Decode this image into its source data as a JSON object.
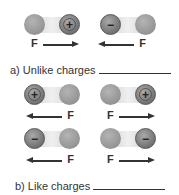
{
  "figure": {
    "section_a": {
      "label": "a) Unlike charges",
      "pairs": [
        {
          "left": {
            "type": "neutral",
            "sign": ""
          },
          "right": {
            "type": "charged",
            "sign": "+"
          },
          "force_label": "F",
          "force_direction": "right"
        },
        {
          "left": {
            "type": "charged",
            "sign": "−"
          },
          "right": {
            "type": "neutral",
            "sign": ""
          },
          "force_label": "F",
          "force_direction": "left"
        }
      ]
    },
    "section_b": {
      "label": "b) Like charges",
      "pairs": [
        {
          "left": {
            "type": "charged",
            "sign": "+"
          },
          "right": {
            "type": "neutral",
            "sign": ""
          },
          "force_label": "F",
          "force_direction": "left"
        },
        {
          "left": {
            "type": "neutral",
            "sign": ""
          },
          "right": {
            "type": "charged",
            "sign": "+"
          },
          "force_label": "F",
          "force_direction": "right"
        },
        {
          "left": {
            "type": "charged",
            "sign": "−"
          },
          "right": {
            "type": "neutral",
            "sign": ""
          },
          "force_label": "F",
          "force_direction": "left"
        },
        {
          "left": {
            "type": "neutral",
            "sign": ""
          },
          "right": {
            "type": "charged",
            "sign": "−"
          },
          "force_label": "F",
          "force_direction": "right"
        }
      ]
    },
    "colors": {
      "neutral_ball": "#9e9e9e",
      "charged_ball": "#7a7a7a",
      "bar": "#e2e2e2",
      "text": "#333333"
    }
  }
}
